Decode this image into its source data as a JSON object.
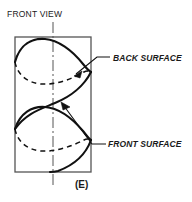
{
  "figure": {
    "caption": "(E)",
    "view_label": "FRONT VIEW",
    "annotations": [
      {
        "id": "back-surface",
        "text": "BACK SURFACE"
      },
      {
        "id": "front-surface",
        "text": "FRONT SURFACE"
      }
    ],
    "colors": {
      "ink": "#1a1a1a",
      "outline": "#555555",
      "background": "#ffffff"
    },
    "geometry": {
      "cylinder_rect": {
        "x": 15,
        "y": 37,
        "width": 76,
        "height": 135
      },
      "axis_x": 53,
      "axis_top": 22,
      "axis_bottom": 188,
      "turns": 2,
      "pitch": 67
    },
    "icons": {
      "back_arrow": "arrow-head-icon",
      "front_arrow": "arrow-head-icon",
      "centerline": "center-axis-line"
    }
  }
}
